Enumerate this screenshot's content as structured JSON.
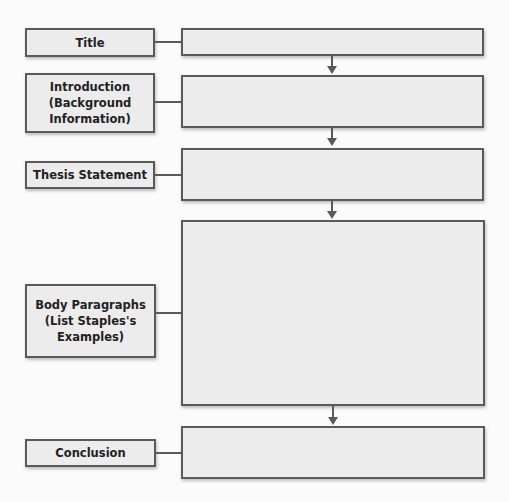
{
  "diagram": {
    "type": "flowchart",
    "colors": {
      "box_fill": "#ececec",
      "box_border": "#5a5a5a",
      "background": "#fbfbfb",
      "text": "#222222"
    },
    "rows": [
      {
        "label": "Title",
        "content": ""
      },
      {
        "label": "Introduction (Background Information)",
        "content": ""
      },
      {
        "label": "Thesis Statement",
        "content": ""
      },
      {
        "label": "Body Paragraphs (List Staples's Examples)",
        "content": ""
      },
      {
        "label": "Conclusion",
        "content": ""
      }
    ]
  }
}
